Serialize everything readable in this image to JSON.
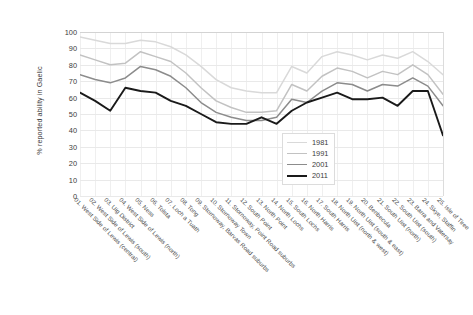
{
  "chart_data": {
    "type": "line",
    "title": "",
    "xlabel": "",
    "ylabel": "% reported ability in Gaelic",
    "ylim": [
      0,
      100
    ],
    "ytick_step": 10,
    "yticks": [
      100,
      90,
      80,
      70,
      60,
      50,
      40,
      30,
      20,
      10,
      0
    ],
    "grid": true,
    "legend_position": "center-right-inside",
    "categories": [
      "01. West Side of Lewis (central)",
      "02. West Side of Lewis (south)",
      "03. Uig District",
      "04. West Side of Lewis (north)",
      "05. Ness",
      "06. Tolsta",
      "07. Loch a Tuath",
      "08. Tong",
      "09. Stornoway, Barvas Road suburbs",
      "10. Stornoway Town",
      "11. Stornoway, Point Road suburbs",
      "12. South Point",
      "13. North Point",
      "14. North Lochs",
      "15. South Lochs",
      "16. North Harris",
      "17. South Harris",
      "18. North Uist (north & west)",
      "19. North Uist (south & east)",
      "20. Benbecula",
      "21. South Uist (north)",
      "22. South Uist (south)",
      "23. Barra and Vatersay",
      "24. Skye, Staffin",
      "25. Isle of Tiree"
    ],
    "series": [
      {
        "name": "1981",
        "color": "#d9d9d9",
        "values": [
          97,
          95,
          93,
          93,
          95,
          94,
          91,
          86,
          79,
          71,
          66,
          64,
          63,
          63,
          79,
          75,
          85,
          88,
          86,
          83,
          86,
          84,
          88,
          82,
          74
        ],
        "_visual_note": "lightest grey line"
      },
      {
        "name": "1991",
        "color": "#c2c2c2",
        "values": [
          86,
          83,
          80,
          81,
          88,
          85,
          82,
          75,
          66,
          58,
          54,
          51,
          51,
          52,
          68,
          64,
          73,
          78,
          76,
          72,
          76,
          74,
          80,
          74,
          62
        ],
        "_visual_note": "light grey line"
      },
      {
        "name": "2001",
        "color": "#8c8c8c",
        "values": [
          74,
          71,
          69,
          72,
          79,
          77,
          73,
          66,
          57,
          51,
          48,
          46,
          46,
          48,
          59,
          57,
          64,
          69,
          68,
          64,
          68,
          67,
          72,
          67,
          55
        ],
        "_visual_note": "medium grey line"
      },
      {
        "name": "2011",
        "color": "#1a1a1a",
        "values": [
          63,
          58,
          52,
          66,
          64,
          63,
          58,
          55,
          50,
          45,
          44,
          44,
          48,
          44,
          52,
          57,
          60,
          63,
          59,
          59,
          60,
          55,
          64,
          64,
          37
        ],
        "_visual_note": "black line, lowest series"
      }
    ]
  },
  "legend": {
    "entries": [
      {
        "label": "1981"
      },
      {
        "label": "1991"
      },
      {
        "label": "2001"
      },
      {
        "label": "2011"
      }
    ]
  }
}
